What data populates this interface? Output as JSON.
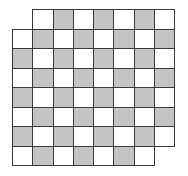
{
  "board": {
    "rows": 8,
    "cols": 8,
    "removed_cells": [
      [
        0,
        0
      ],
      [
        7,
        7
      ]
    ],
    "dark_rule": "(row + col) even",
    "colors": {
      "dark": "#c4c4c4",
      "light": "#ffffff",
      "line": "#3a3a3a",
      "background": "#ffffff"
    }
  }
}
